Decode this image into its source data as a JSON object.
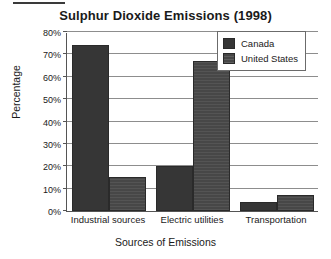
{
  "chart_data": {
    "type": "bar",
    "title": "Sulphur Dioxide Emissions (1998)",
    "xlabel": "Sources of Emissions",
    "ylabel": "Percentage",
    "categories": [
      "Industrial sources",
      "Electric utilities",
      "Transportation"
    ],
    "series": [
      {
        "name": "Canada",
        "values": [
          74,
          20,
          4
        ],
        "color": "#363636"
      },
      {
        "name": "United States",
        "values": [
          15,
          67,
          7
        ],
        "color": "#474747"
      }
    ],
    "ylim": [
      0,
      80
    ],
    "ytick_values": [
      0,
      10,
      20,
      30,
      40,
      50,
      60,
      70,
      80
    ],
    "ytick_labels": [
      "0%",
      "10%",
      "20%",
      "30%",
      "40%",
      "50%",
      "60%",
      "70%",
      "80%"
    ],
    "grid": true,
    "legend_position": "top-right",
    "value_suffix": "%"
  }
}
